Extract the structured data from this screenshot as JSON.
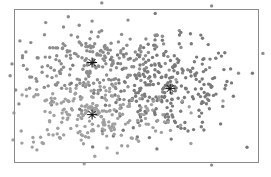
{
  "chart_data": {
    "type": "scatter",
    "title": "",
    "xlabel": "",
    "ylabel": "",
    "grid": false,
    "legend": null,
    "axes_ticks": "none",
    "plot_area_px": {
      "x0": 14,
      "y0": 9,
      "x1": 258,
      "y1": 162
    },
    "xlim": [
      0,
      1
    ],
    "ylim": [
      0,
      1
    ],
    "clusters": [
      {
        "name": "cluster-1",
        "color": "#8c8c8c",
        "n": 240,
        "center": [
          0.33,
          0.65
        ],
        "spread": [
          0.17,
          0.16
        ]
      },
      {
        "name": "cluster-2",
        "color": "#7a7a7a",
        "n": 260,
        "center": [
          0.64,
          0.48
        ],
        "spread": [
          0.14,
          0.2
        ]
      },
      {
        "name": "cluster-3",
        "color": "#a0a0a0",
        "n": 230,
        "center": [
          0.32,
          0.31
        ],
        "spread": [
          0.17,
          0.15
        ]
      }
    ],
    "centroids": [
      {
        "x": 0.32,
        "y": 0.65,
        "marker": "asterisk"
      },
      {
        "x": 0.64,
        "y": 0.48,
        "marker": "asterisk"
      },
      {
        "x": 0.32,
        "y": 0.31,
        "marker": "asterisk"
      }
    ],
    "outliers": [
      {
        "x": 0.36,
        "y": 1.04
      },
      {
        "x": 0.81,
        "y": 1.02
      },
      {
        "x": 0.92,
        "y": 0.58
      },
      {
        "x": 0.02,
        "y": 0.38
      },
      {
        "x": 0.81,
        "y": -0.02
      },
      {
        "x": 1.02,
        "y": 0.71
      }
    ],
    "point_radius": 1.7
  }
}
